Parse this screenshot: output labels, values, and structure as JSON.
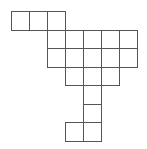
{
  "diagram": {
    "type": "grid-net",
    "cell_width": 18,
    "cell_height": 18.5,
    "origin_x": 11,
    "origin_y": 11,
    "line_color": "#555555",
    "fill_color": "#ffffff",
    "cells": [
      {
        "row": 0,
        "col": 0
      },
      {
        "row": 0,
        "col": 1
      },
      {
        "row": 0,
        "col": 2
      },
      {
        "row": 1,
        "col": 2
      },
      {
        "row": 1,
        "col": 3
      },
      {
        "row": 1,
        "col": 4
      },
      {
        "row": 1,
        "col": 5
      },
      {
        "row": 1,
        "col": 6
      },
      {
        "row": 2,
        "col": 2
      },
      {
        "row": 2,
        "col": 3
      },
      {
        "row": 2,
        "col": 4
      },
      {
        "row": 2,
        "col": 5
      },
      {
        "row": 2,
        "col": 6
      },
      {
        "row": 3,
        "col": 3
      },
      {
        "row": 3,
        "col": 4
      },
      {
        "row": 3,
        "col": 5
      },
      {
        "row": 4,
        "col": 4
      },
      {
        "row": 5,
        "col": 4
      },
      {
        "row": 6,
        "col": 3
      },
      {
        "row": 6,
        "col": 4
      }
    ]
  }
}
